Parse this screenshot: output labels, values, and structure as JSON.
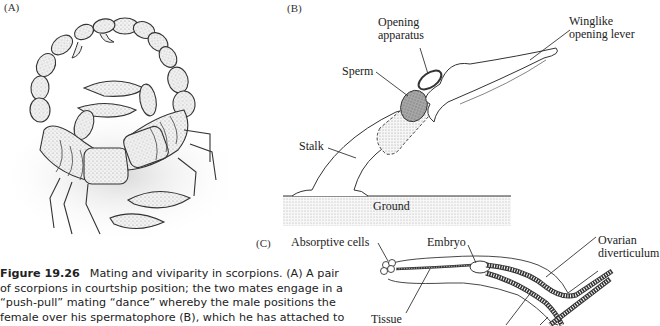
{
  "panels": {
    "a": {
      "label": "(A)",
      "subject": "scorpion-pair-courtship-illustration"
    },
    "b": {
      "label": "(B)",
      "annotations": {
        "opening_apparatus_line1": "Opening",
        "opening_apparatus_line2": "apparatus",
        "winglike_line1": "Winglike",
        "winglike_line2": "opening lever",
        "sperm": "Sperm",
        "stalk": "Stalk",
        "ground": "Ground"
      }
    },
    "c": {
      "label": "(C)",
      "annotations": {
        "absorptive_cells": "Absorptive cells",
        "embryo": "Embryo",
        "ovarian_line1": "Ovarian",
        "ovarian_line2": "diverticulum",
        "tissue": "Tissue"
      }
    }
  },
  "caption": {
    "figure_number": "Figure 19.26",
    "lines": [
      "Mating and viviparity in scorpions. (A) A pair",
      "of scorpions in courtship position; the two mates engage in a",
      "“push-pull” mating “dance” whereby the male positions the",
      "female over his spermatophore (B), which he has attached to"
    ]
  }
}
